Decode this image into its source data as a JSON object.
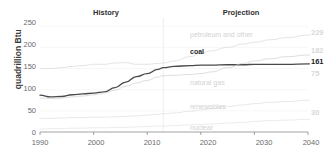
{
  "chart_data": {
    "type": "line",
    "title": "",
    "xlabel": "",
    "ylabel": "quadrillion Btu",
    "xlim": [
      1990,
      2040
    ],
    "ylim": [
      0,
      260
    ],
    "yticks": [
      "0",
      "50",
      "100",
      "150",
      "200",
      "250"
    ],
    "ytick_values": [
      0,
      50,
      100,
      150,
      200,
      250
    ],
    "xticks": [
      "1990",
      "2000",
      "2010",
      "2020",
      "2030",
      "2040"
    ],
    "xtick_values": [
      1990,
      2000,
      2010,
      2020,
      2030,
      2040
    ],
    "grid": false,
    "legend": "inline-series-labels",
    "history_projection_split": 2013,
    "annotations": {
      "history_label": "History",
      "projection_label": "Projection"
    },
    "x": [
      1990,
      1992,
      1994,
      1996,
      1998,
      2000,
      2002,
      2004,
      2006,
      2008,
      2010,
      2012,
      2013,
      2015,
      2018,
      2020,
      2022,
      2025,
      2028,
      2030,
      2033,
      2036,
      2040
    ],
    "series": [
      {
        "name": "petroleum and other",
        "label": "petroleum and other",
        "emphasis": "faint",
        "color": "#d9d9d9",
        "end_value_label": "229",
        "values": [
          150,
          150,
          152,
          155,
          157,
          160,
          160,
          163,
          164,
          160,
          160,
          162,
          163,
          168,
          178,
          186,
          192,
          200,
          208,
          212,
          218,
          223,
          229
        ]
      },
      {
        "name": "coal",
        "label": "coal",
        "emphasis": "dark",
        "color": "#4a4a4a",
        "end_value_label": "161",
        "values": [
          87,
          83,
          84,
          88,
          90,
          92,
          95,
          105,
          118,
          131,
          138,
          148,
          152,
          155,
          157,
          158,
          158,
          159,
          159,
          160,
          160,
          160,
          161
        ]
      },
      {
        "name": "natural gas",
        "label": "natural gas",
        "emphasis": "faint",
        "color": "#cfcfcf",
        "end_value_label": "182",
        "values": [
          80,
          79,
          80,
          83,
          85,
          88,
          92,
          99,
          108,
          116,
          122,
          130,
          133,
          134,
          136,
          138,
          142,
          152,
          162,
          168,
          173,
          178,
          182
        ]
      },
      {
        "name": "renewables",
        "label": "renewables",
        "emphasis": "faint",
        "color": "#dedede",
        "end_value_label": "75",
        "values": [
          32,
          32,
          33,
          34,
          34,
          35,
          35,
          36,
          37,
          38,
          40,
          42,
          43,
          45,
          49,
          52,
          55,
          60,
          64,
          67,
          70,
          72,
          75
        ]
      },
      {
        "name": "nuclear",
        "label": "nuclear",
        "emphasis": "faint",
        "color": "#e2e2e2",
        "end_value_label": "30",
        "values": [
          7,
          8,
          8,
          9,
          9,
          10,
          10,
          11,
          11,
          12,
          13,
          14,
          14,
          15,
          17,
          18,
          19,
          21,
          23,
          25,
          27,
          28,
          30
        ]
      }
    ]
  }
}
